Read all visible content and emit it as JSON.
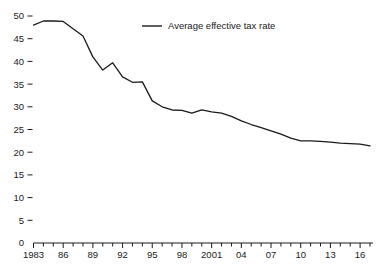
{
  "chart_data": {
    "type": "line",
    "title": "",
    "subtitle": "",
    "xlabel": "",
    "ylabel": "",
    "ylim": [
      0,
      50
    ],
    "xlim": [
      1983,
      2017
    ],
    "grid": false,
    "legend_position": "top-center",
    "y_ticks": [
      0,
      5,
      10,
      15,
      20,
      25,
      30,
      35,
      40,
      45,
      50
    ],
    "y_tick_labels": [
      "0",
      "5",
      "10",
      "15",
      "20",
      "25",
      "30",
      "35",
      "40",
      "45",
      "50"
    ],
    "x_tick_years": [
      1983,
      1984,
      1985,
      1986,
      1987,
      1988,
      1989,
      1990,
      1991,
      1992,
      1993,
      1994,
      1995,
      1996,
      1997,
      1998,
      1999,
      2000,
      2001,
      2002,
      2003,
      2004,
      2005,
      2006,
      2007,
      2008,
      2009,
      2010,
      2011,
      2012,
      2013,
      2014,
      2015,
      2016,
      2017
    ],
    "x_labeled_ticks": [
      {
        "year": 1983,
        "label": "1983"
      },
      {
        "year": 1986,
        "label": "86"
      },
      {
        "year": 1989,
        "label": "89"
      },
      {
        "year": 1992,
        "label": "92"
      },
      {
        "year": 1995,
        "label": "95"
      },
      {
        "year": 1998,
        "label": "98"
      },
      {
        "year": 2001,
        "label": "2001"
      },
      {
        "year": 2004,
        "label": "04"
      },
      {
        "year": 2007,
        "label": "07"
      },
      {
        "year": 2010,
        "label": "10"
      },
      {
        "year": 2013,
        "label": "13"
      },
      {
        "year": 2016,
        "label": "16"
      }
    ],
    "series": [
      {
        "name": "Average effective tax rate",
        "color": "#1a1a1a",
        "x": [
          1983,
          1984,
          1985,
          1986,
          1987,
          1988,
          1989,
          1990,
          1991,
          1992,
          1993,
          1994,
          1995,
          1996,
          1997,
          1998,
          1999,
          2000,
          2001,
          2002,
          2003,
          2004,
          2005,
          2006,
          2007,
          2008,
          2009,
          2010,
          2011,
          2012,
          2013,
          2014,
          2015,
          2016,
          2017
        ],
        "values": [
          48.0,
          48.9,
          48.9,
          48.8,
          47.2,
          45.6,
          41.0,
          38.1,
          39.7,
          36.6,
          35.4,
          35.5,
          31.3,
          30.0,
          29.3,
          29.2,
          28.6,
          29.3,
          28.9,
          28.6,
          27.9,
          26.9,
          26.1,
          25.4,
          24.7,
          24.0,
          23.1,
          22.5,
          22.5,
          22.4,
          22.2,
          22.0,
          21.9,
          21.8,
          21.4
        ]
      }
    ]
  },
  "legend": {
    "entries": [
      {
        "label": "Average effective tax rate"
      }
    ]
  }
}
